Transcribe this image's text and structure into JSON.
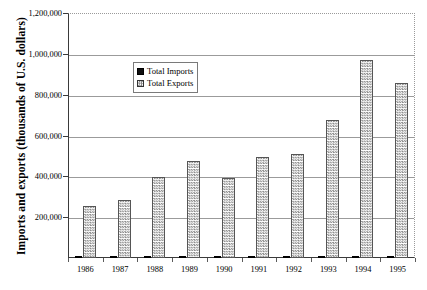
{
  "chart_data": {
    "type": "bar",
    "title": "",
    "subtitle": "",
    "xlabel": "",
    "ylabel": "Imports and exports (thousands of U.S. dollars)",
    "categories": [
      "1986",
      "1987",
      "1988",
      "1989",
      "1990",
      "1991",
      "1992",
      "1993",
      "1994",
      "1995"
    ],
    "series": [
      {
        "name": "Total Imports",
        "color": "#101010",
        "pattern": "solid",
        "values": [
          1200,
          7500,
          11000,
          2000,
          1500,
          1800,
          1200,
          1500,
          4500,
          3000
        ]
      },
      {
        "name": "Total Exports",
        "color": "#8c8c8c",
        "pattern": "checker",
        "values": [
          255000,
          282000,
          398000,
          473000,
          393000,
          493000,
          510000,
          675000,
          970000,
          855000
        ]
      }
    ],
    "ylim": [
      0,
      1200000
    ],
    "ytick_values": [
      0,
      200000,
      400000,
      600000,
      800000,
      1000000,
      1200000
    ],
    "ytick_labels": [
      "",
      "200,000",
      "400,000",
      "600,000",
      "800,000",
      "1,000,000",
      "1,200,000"
    ],
    "grid": "horizontal",
    "grid_color": "#9b9b9b",
    "legend_position": "upper-left-inside",
    "legend_entries": [
      "Total Imports",
      "Total Exports"
    ],
    "frame": {
      "left_axis": "solid",
      "bottom_axis": "solid",
      "top_border": "dotted",
      "right_border": "dotted"
    }
  },
  "axis": {
    "y_title": "Imports and exports (thousands of U.S. dollars)"
  }
}
